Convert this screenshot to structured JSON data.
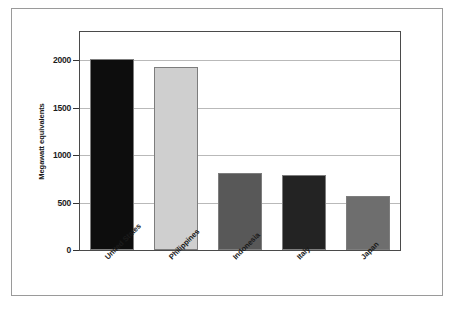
{
  "chart_data": {
    "type": "bar",
    "title": "",
    "subtitle": "",
    "xlabel": "",
    "ylabel": "Megawatt equivalents",
    "categories": [
      "United States",
      "Philippines",
      "Indonesia",
      "Italy",
      "Japan"
    ],
    "values": [
      2020,
      1930,
      815,
      795,
      565
    ],
    "series": [
      {
        "name": "Megawatt equivalents",
        "values": [
          2020,
          1930,
          815,
          795,
          565
        ]
      }
    ],
    "bar_colors": [
      "#0d0d0d",
      "#cfcfcf",
      "#585858",
      "#232323",
      "#6e6e6e"
    ],
    "ylim": [
      0,
      2300
    ],
    "ytick_labels": [
      "0",
      "500",
      "1000",
      "1500",
      "2000"
    ],
    "ytick_values": [
      0,
      500,
      1000,
      1500,
      2000
    ],
    "grid": true,
    "grid_axis": "y",
    "legend": false,
    "legend_position": "none",
    "xtick_rotation": -45
  },
  "figure": {
    "caption": "",
    "frame_color": "#9a9a9a",
    "plot_frame_color": "#4a4a4a",
    "gridline_color": "#b9b9b9",
    "background": "#ffffff"
  }
}
